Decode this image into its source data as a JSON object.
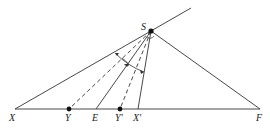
{
  "diagram": {
    "points": {
      "S": {
        "label": "S",
        "x": 151,
        "y": 31
      },
      "X": {
        "label": "X",
        "x": 15,
        "y": 109
      },
      "Y": {
        "label": "Y",
        "x": 69,
        "y": 109
      },
      "E": {
        "label": "E",
        "x": 96,
        "y": 109
      },
      "Yp": {
        "label": "Y′",
        "x": 120,
        "y": 109
      },
      "Xp": {
        "label": "X′",
        "x": 138,
        "y": 109
      },
      "F": {
        "label": "F",
        "x": 260,
        "y": 109
      }
    },
    "line_color": "#333333"
  }
}
